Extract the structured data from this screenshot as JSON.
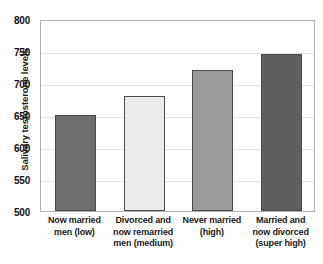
{
  "chart_data": {
    "type": "bar",
    "title": "",
    "xlabel": "",
    "ylabel": "Salivary testosterone levels",
    "ylim": [
      500,
      800
    ],
    "yticks": [
      500,
      550,
      600,
      650,
      700,
      750,
      800
    ],
    "grid": true,
    "legend": "none",
    "categories": [
      "Now married men (low)",
      "Divorced and now remarried men (medium)",
      "Never married (high)",
      "Married and now divorced (super high)"
    ],
    "category_lines": [
      [
        "Now married",
        "men (low)"
      ],
      [
        "Divorced and",
        "now remarried",
        "men (medium)"
      ],
      [
        "Never married",
        "(high)"
      ],
      [
        "Married and",
        "now divorced",
        "(super high)"
      ]
    ],
    "values": [
      650,
      680,
      720,
      745
    ],
    "bar_colors": [
      "#6e6e6e",
      "#ebebeb",
      "#9a9a9a",
      "#5e5e5e"
    ],
    "bar_edge_color": "#4a4a4a",
    "grid_color": "#e2e2e2",
    "axis_color": "#b4b4b4"
  }
}
